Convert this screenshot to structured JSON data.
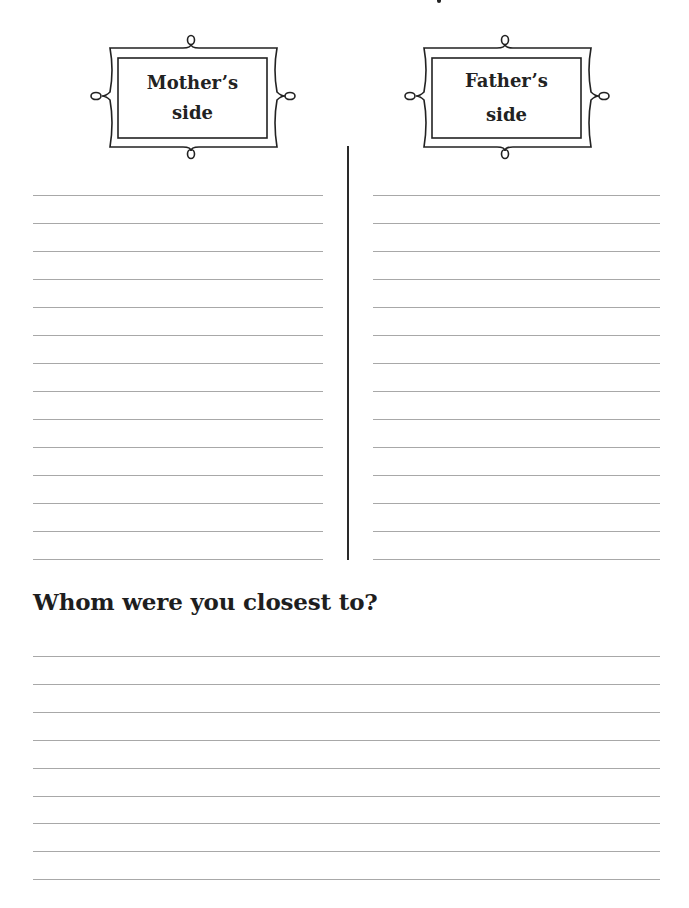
{
  "frames": {
    "mother": {
      "label_line1": "Mother’s",
      "label_line2": "side"
    },
    "father": {
      "label_line1": "Father’s",
      "label_line2": "side"
    }
  },
  "columns": {
    "left_line_count": 14,
    "right_line_count": 14
  },
  "section": {
    "heading": "Whom were you closest to?",
    "line_count": 9
  }
}
